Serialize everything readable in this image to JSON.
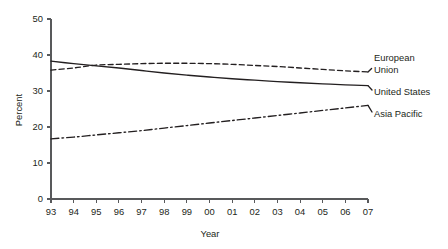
{
  "chart_data": {
    "type": "line",
    "title": "",
    "subtitle": "",
    "xlabel": "Year",
    "ylabel": "Percent",
    "xlim": [
      1993,
      2007
    ],
    "ylim": [
      0,
      50
    ],
    "yticks": [
      0,
      10,
      20,
      30,
      40,
      50
    ],
    "ytick_labels": [
      "0",
      "10",
      "20",
      "30",
      "40",
      "50"
    ],
    "x": [
      1993,
      1994,
      1995,
      1996,
      1997,
      1998,
      1999,
      2000,
      2001,
      2002,
      2003,
      2004,
      2005,
      2006,
      2007
    ],
    "xtick_labels": [
      "93",
      "94",
      "95",
      "96",
      "97",
      "98",
      "99",
      "00",
      "01",
      "02",
      "03",
      "04",
      "05",
      "06",
      "07"
    ],
    "grid": false,
    "legend_position": "right-of-plot",
    "series": [
      {
        "name": "European Union",
        "style": "dashed",
        "color": "#231f20",
        "values": [
          35.8,
          36.4,
          37.2,
          37.4,
          37.6,
          37.7,
          37.7,
          37.6,
          37.4,
          37.1,
          36.8,
          36.4,
          36.0,
          35.6,
          35.3
        ]
      },
      {
        "name": "United States",
        "style": "solid",
        "color": "#231f20",
        "values": [
          38.3,
          37.6,
          37.0,
          36.4,
          35.7,
          35.0,
          34.4,
          33.9,
          33.4,
          33.0,
          32.6,
          32.3,
          32.0,
          31.7,
          31.5
        ]
      },
      {
        "name": "Asia Pacific",
        "style": "dash-dot",
        "color": "#231f20",
        "values": [
          16.7,
          17.2,
          17.8,
          18.4,
          19.0,
          19.7,
          20.4,
          21.1,
          21.8,
          22.5,
          23.2,
          23.9,
          24.6,
          25.3,
          26.0
        ]
      }
    ]
  },
  "legend": {
    "items": [
      {
        "line1": "European",
        "line2": "Union"
      },
      {
        "line1": "United States",
        "line2": ""
      },
      {
        "line1": "Asia Pacific",
        "line2": ""
      }
    ]
  }
}
